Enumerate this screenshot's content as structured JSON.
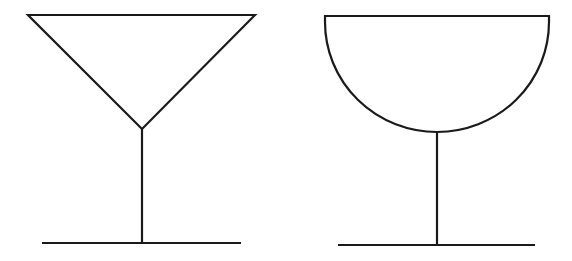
{
  "diagram": {
    "stroke_color": "#1a1a1a",
    "background": "#ffffff",
    "glasses": [
      {
        "name": "conical-glass",
        "bowl_shape": "inverted-triangle",
        "rim": {
          "x1": 28,
          "x2": 255,
          "y": 15
        },
        "apex": {
          "x": 142,
          "y": 129
        },
        "stem_bottom_y": 243,
        "base": {
          "x1": 42,
          "x2": 241,
          "y": 243
        }
      },
      {
        "name": "hemispherical-glass",
        "bowl_shape": "half-circle",
        "rim": {
          "x1": 325,
          "x2": 549,
          "y": 16
        },
        "bowl_bottom": {
          "x": 437,
          "y": 132
        },
        "stem_bottom_y": 245,
        "base": {
          "x1": 338,
          "x2": 535,
          "y": 245
        }
      }
    ]
  }
}
